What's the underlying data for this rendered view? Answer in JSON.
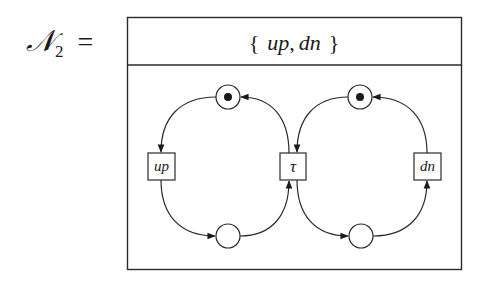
{
  "net": {
    "name_script": "𝒩",
    "name_subscript": "2",
    "equals": "=",
    "alphabet_open": "{",
    "alphabet_actions": [
      "up",
      "dn"
    ],
    "alphabet_separator": ",",
    "alphabet_close": "}"
  },
  "places": [
    {
      "id": "p_top_left",
      "x": 228,
      "y": 97,
      "marked": true
    },
    {
      "id": "p_top_right",
      "x": 360,
      "y": 97,
      "marked": true
    },
    {
      "id": "p_bottom_left",
      "x": 228,
      "y": 236,
      "marked": false
    },
    {
      "id": "p_bottom_right",
      "x": 361,
      "y": 236,
      "marked": false
    }
  ],
  "transitions": [
    {
      "id": "t_up",
      "label": "up",
      "x": 161,
      "y": 166
    },
    {
      "id": "t_tau",
      "label": "τ",
      "x": 293,
      "y": 166
    },
    {
      "id": "t_dn",
      "label": "dn",
      "x": 427,
      "y": 166
    }
  ],
  "arcs": [
    {
      "from": "p_top_left",
      "to": "t_up"
    },
    {
      "from": "t_up",
      "to": "p_bottom_left"
    },
    {
      "from": "p_bottom_left",
      "to": "t_tau"
    },
    {
      "from": "t_tau",
      "to": "p_top_left"
    },
    {
      "from": "p_top_right",
      "to": "t_tau"
    },
    {
      "from": "t_tau",
      "to": "p_bottom_right"
    },
    {
      "from": "p_bottom_right",
      "to": "t_dn"
    },
    {
      "from": "t_dn",
      "to": "p_top_right"
    }
  ],
  "labels": {
    "action_up": "up",
    "action_dn": "dn",
    "action_tau": "τ"
  }
}
